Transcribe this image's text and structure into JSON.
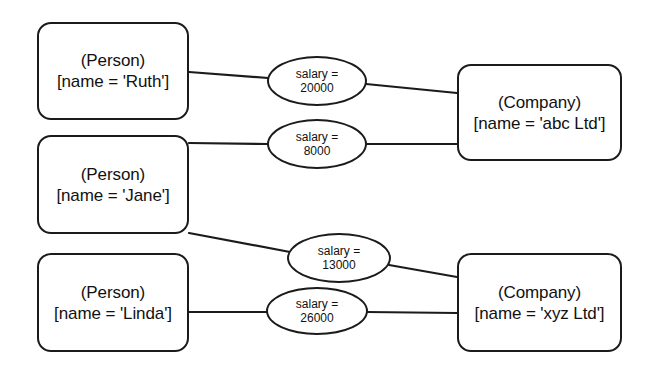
{
  "diagram": {
    "background_color": "#ffffff",
    "stroke_color": "#1b1b1b",
    "text_color": "#111111",
    "nodes": [
      {
        "id": "person-ruth",
        "kind": "Person",
        "type_label": "(Person)",
        "attr_label": "[name = 'Ruth']",
        "x": 37,
        "y": 22,
        "w": 152,
        "h": 98
      },
      {
        "id": "person-jane",
        "kind": "Person",
        "type_label": "(Person)",
        "attr_label": "[name = 'Jane']",
        "x": 37,
        "y": 135,
        "w": 152,
        "h": 99
      },
      {
        "id": "person-linda",
        "kind": "Person",
        "type_label": "(Person)",
        "attr_label": "[name = 'Linda']",
        "x": 37,
        "y": 253,
        "w": 152,
        "h": 99
      },
      {
        "id": "company-abc",
        "kind": "Company",
        "type_label": "(Company)",
        "attr_label": "[name = 'abc Ltd']",
        "x": 457,
        "y": 64,
        "w": 165,
        "h": 97
      },
      {
        "id": "company-xyz",
        "kind": "Company",
        "type_label": "(Company)",
        "attr_label": "[name = 'xyz Ltd']",
        "x": 457,
        "y": 253,
        "w": 165,
        "h": 99
      }
    ],
    "edges": [
      {
        "id": "edge-ruth-abc",
        "from": "person-ruth",
        "to": "company-abc",
        "attribute": "salary",
        "value": "20000",
        "label_line1": "salary =",
        "label_line2": "20000",
        "ellipse": {
          "cx": 317,
          "cy": 81,
          "rx": 50,
          "ry": 25
        },
        "path_from": {
          "x": 189,
          "y": 72
        },
        "path_to": {
          "x": 457,
          "y": 93
        }
      },
      {
        "id": "edge-jane-abc",
        "from": "person-jane",
        "to": "company-abc",
        "attribute": "salary",
        "value": "8000",
        "label_line1": "salary =",
        "label_line2": "8000",
        "ellipse": {
          "cx": 317,
          "cy": 144,
          "rx": 50,
          "ry": 25
        },
        "path_from": {
          "x": 189,
          "y": 143
        },
        "path_to": {
          "x": 457,
          "y": 144
        }
      },
      {
        "id": "edge-jane-xyz",
        "from": "person-jane",
        "to": "company-xyz",
        "attribute": "salary",
        "value": "13000",
        "label_line1": "salary =",
        "label_line2": "13000",
        "ellipse": {
          "cx": 339,
          "cy": 258,
          "rx": 52,
          "ry": 25
        },
        "path_from": {
          "x": 189,
          "y": 233
        },
        "path_to": {
          "x": 457,
          "y": 277
        }
      },
      {
        "id": "edge-linda-xyz",
        "from": "person-linda",
        "to": "company-xyz",
        "attribute": "salary",
        "value": "26000",
        "label_line1": "salary =",
        "label_line2": "26000",
        "ellipse": {
          "cx": 317,
          "cy": 311,
          "rx": 51,
          "ry": 24
        },
        "path_from": {
          "x": 189,
          "y": 312
        },
        "path_to": {
          "x": 457,
          "y": 313
        }
      }
    ]
  }
}
